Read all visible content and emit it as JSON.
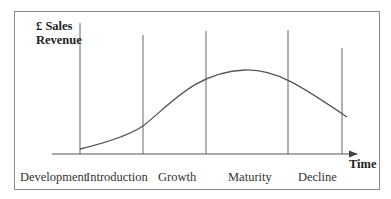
{
  "diagram": {
    "title_y_axis": [
      "£ Sales",
      "Revenue"
    ],
    "x_axis_label": "Time",
    "stages": [
      {
        "name": "Development"
      },
      {
        "name": "Introduction"
      },
      {
        "name": "Growth"
      },
      {
        "name": "Maturity"
      },
      {
        "name": "Decline"
      }
    ],
    "curve_description": "Sales revenue rises slowly during Introduction, accelerates in Growth, peaks in Maturity and falls in Decline",
    "line_color": "#666666"
  }
}
